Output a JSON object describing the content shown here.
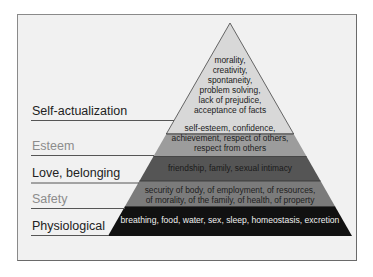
{
  "levels": [
    {
      "label": "Self-actualization",
      "description_lines": [
        "morality,",
        "creativity,",
        "spontaneity,",
        "problem solving,",
        "lack of prejudice,",
        "acceptance of facts"
      ],
      "color": "#d8d8d8",
      "text_color": "#222222"
    },
    {
      "label": "Esteem",
      "description_lines": [
        "self-esteem, confidence,",
        "achievement, respect of others,",
        "respect from others"
      ],
      "color": "#9c9c9c",
      "text_color": "#222222"
    },
    {
      "label": "Love, belonging",
      "description_lines": [
        "friendship, family, sexual intimacy"
      ],
      "color": "#555555",
      "text_color": "#1a1a1a"
    },
    {
      "label": "Safety",
      "description_lines": [
        "security of body, of employment, of resources,",
        "of morality, of the family, of health, of property"
      ],
      "color": "#7b7b7b",
      "text_color": "#1e1e1e"
    },
    {
      "label": "Physiological",
      "description_lines": [
        "breathing, food, water, sex, sleep, homeostasis, excretion"
      ],
      "color": "#111111",
      "text_color": "#f0f0f0"
    }
  ]
}
